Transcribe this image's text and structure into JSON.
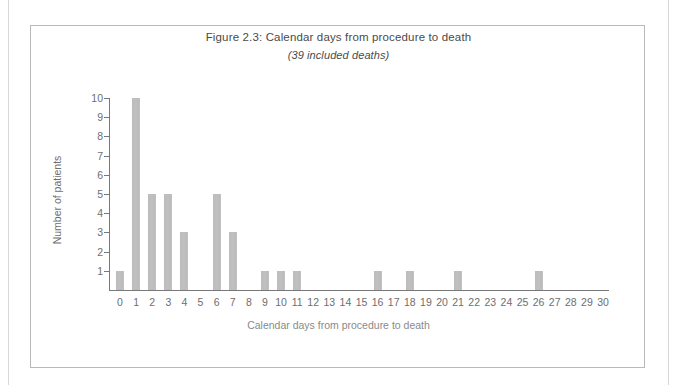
{
  "figure": {
    "title": "Figure 2.3: Calendar days from procedure to death",
    "subtitle": "(39 included deaths)"
  },
  "colors": {
    "bar": "#bdbdbd",
    "axis": "#787878",
    "text": "#6e6e6e",
    "frame": "#b9b9b9",
    "background": "#ffffff"
  },
  "chart_data": {
    "type": "bar",
    "title": "Figure 2.3: Calendar days from procedure to death",
    "subtitle": "(39 included deaths)",
    "xlabel": "Calendar days from procedure to death",
    "ylabel": "Number of patients",
    "categories": [
      "0",
      "1",
      "2",
      "3",
      "4",
      "5",
      "6",
      "7",
      "8",
      "9",
      "10",
      "11",
      "12",
      "13",
      "14",
      "15",
      "16",
      "17",
      "18",
      "19",
      "20",
      "21",
      "22",
      "23",
      "24",
      "25",
      "26",
      "27",
      "28",
      "29",
      "30"
    ],
    "values": [
      1,
      10,
      5,
      5,
      3,
      0,
      5,
      3,
      0,
      1,
      1,
      1,
      0,
      0,
      0,
      0,
      1,
      0,
      1,
      0,
      0,
      1,
      0,
      0,
      0,
      0,
      1,
      0,
      0,
      0,
      0
    ],
    "total": 39,
    "ylim": [
      0,
      10
    ],
    "yticks": [
      1,
      2,
      3,
      4,
      5,
      6,
      7,
      8,
      9,
      10
    ],
    "ytick_labels": [
      "1",
      "2",
      "3",
      "4",
      "5",
      "6",
      "7",
      "8",
      "9",
      "10"
    ],
    "grid": false,
    "legend": false
  }
}
